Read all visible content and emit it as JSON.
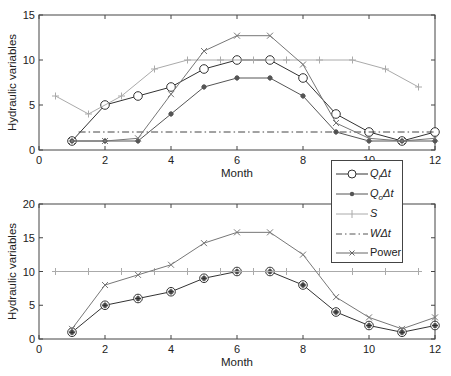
{
  "chart_data": [
    {
      "type": "line",
      "title": "",
      "xlabel": "Month",
      "ylabel": "Hydraulic variables",
      "xlim": [
        0,
        12
      ],
      "ylim": [
        0,
        15
      ],
      "xticks": [
        0,
        2,
        4,
        6,
        8,
        10,
        12
      ],
      "yticks": [
        0,
        5,
        10,
        15
      ],
      "grid": false,
      "legend_position": "outside-right-between-panels",
      "series": [
        {
          "name": "QiΔt",
          "marker": "circle",
          "color": "#333333",
          "x": [
            1,
            2,
            3,
            4,
            5,
            6,
            7,
            8,
            9,
            10,
            11,
            12
          ],
          "values": [
            1,
            5,
            6,
            7,
            9,
            10,
            10,
            8,
            4,
            2,
            1,
            2
          ]
        },
        {
          "name": "QoΔt",
          "marker": "star",
          "color": "#555555",
          "x": [
            1,
            2,
            3,
            4,
            5,
            6,
            7,
            8,
            9,
            10,
            11,
            12
          ],
          "values": [
            1,
            1,
            1,
            4,
            7,
            8,
            8,
            6,
            2,
            1,
            1,
            1
          ]
        },
        {
          "name": "S",
          "marker": "plus",
          "color": "#aaaaaa",
          "x": [
            0.5,
            1.5,
            2.5,
            3.5,
            4.5,
            5.5,
            6.5,
            7.5,
            8.5,
            9.5,
            10.5,
            11.5
          ],
          "values": [
            6,
            4,
            6,
            9,
            10,
            10,
            10,
            10,
            10,
            10,
            9,
            7
          ]
        },
        {
          "name": "WΔt",
          "marker": "none",
          "linestyle": "dash-dot",
          "color": "#444444",
          "x": [
            1.2,
            12
          ],
          "values": [
            2,
            2
          ]
        },
        {
          "name": "Power",
          "marker": "x",
          "color": "#777777",
          "x": [
            1,
            2,
            3,
            4,
            5,
            6,
            7,
            8,
            9,
            10,
            11,
            12
          ],
          "values": [
            1,
            1,
            1.3,
            6.2,
            11,
            12.7,
            12.7,
            9.5,
            3,
            1.3,
            1,
            1.3
          ]
        }
      ]
    },
    {
      "type": "line",
      "title": "",
      "xlabel": "Month",
      "ylabel": "Hydraulic variables",
      "xlim": [
        0,
        12
      ],
      "ylim": [
        0,
        20
      ],
      "xticks": [
        0,
        2,
        4,
        6,
        8,
        10,
        12
      ],
      "yticks": [
        0,
        5,
        10,
        15,
        20
      ],
      "grid": false,
      "series": [
        {
          "name": "QiΔt",
          "marker": "circle-star",
          "color": "#333333",
          "x": [
            1,
            2,
            3,
            4,
            5,
            6,
            7,
            8,
            9,
            10,
            11,
            12
          ],
          "values": [
            1,
            5,
            6,
            7,
            9,
            10,
            10,
            8,
            4,
            2,
            1,
            2
          ]
        },
        {
          "name": "S",
          "marker": "plus",
          "color": "#aaaaaa",
          "x": [
            0.5,
            1.5,
            2.5,
            3.5,
            4.5,
            5.5,
            6.5,
            7.5,
            8.5,
            9.5,
            10.5,
            11.5
          ],
          "values": [
            10,
            10,
            10,
            10,
            10,
            10,
            10,
            10,
            10,
            10,
            10,
            10
          ]
        },
        {
          "name": "Power",
          "marker": "x",
          "color": "#777777",
          "x": [
            1,
            2,
            3,
            4,
            5,
            6,
            7,
            8,
            9,
            10,
            11,
            12
          ],
          "values": [
            1.5,
            8,
            9.5,
            11,
            14.2,
            15.8,
            15.8,
            12.5,
            6.2,
            3.2,
            1.5,
            3.2
          ]
        }
      ]
    }
  ],
  "legend": {
    "items": [
      {
        "label": "Q",
        "sub": "i",
        "suffix": "Δt"
      },
      {
        "label": "Q",
        "sub": "o",
        "suffix": "Δt"
      },
      {
        "label": "S",
        "sub": "",
        "suffix": ""
      },
      {
        "label": "W",
        "sub": "",
        "suffix": "Δt"
      },
      {
        "label": "Power",
        "sub": "",
        "suffix": ""
      }
    ]
  }
}
